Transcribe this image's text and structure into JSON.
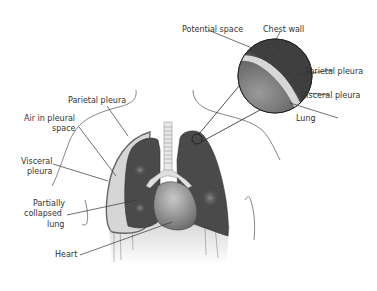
{
  "diagram": {
    "labels": {
      "parietal_pleura_left": "Parietal pleura",
      "air_in_pleural_space_1": "Air in pleural",
      "air_in_pleural_space_2": "space",
      "visceral_pleura_left_1": "Visceral",
      "visceral_pleura_left_2": "pleura",
      "partially_collapsed_1": "Partially",
      "partially_collapsed_2": "collapsed",
      "partially_collapsed_3": "lung",
      "heart": "Heart",
      "potential_space": "Potential space",
      "chest_wall": "Chest wall",
      "parietal_pleura_inset": "Parietal pleura",
      "visceral_pleura_inset": "Visceral pleura",
      "lung_inset": "Lung"
    },
    "colors": {
      "lung": "#4a4a4a",
      "air_space": "#d6d6d6",
      "heart": "#8a8a8a",
      "trachea": "#e0e0e0",
      "outline": "#555555"
    }
  }
}
